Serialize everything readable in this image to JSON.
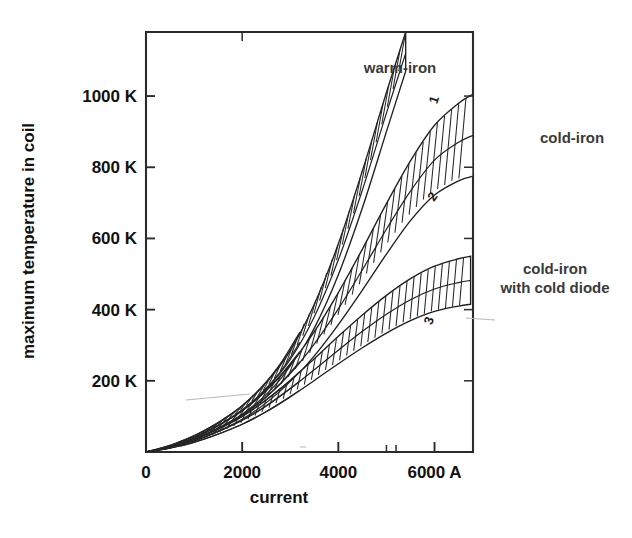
{
  "chart_data": {
    "type": "line",
    "title": "",
    "xlabel": "current",
    "ylabel": "maximum temperature in coil",
    "xlim": [
      0,
      6800
    ],
    "ylim": [
      0,
      1180
    ],
    "xunit": "A",
    "yunit": "K",
    "grid": false,
    "legend_position": "inline-annotations",
    "xticks": [
      {
        "value": 0,
        "label": "0"
      },
      {
        "value": 2000,
        "label": "2000"
      },
      {
        "value": 4000,
        "label": "4000"
      },
      {
        "value": 6000,
        "label": "6000 A"
      }
    ],
    "xminorticks": [
      5000,
      5200
    ],
    "yticks": [
      {
        "value": 200,
        "label": "200 K"
      },
      {
        "value": 400,
        "label": "400 K"
      },
      {
        "value": 600,
        "label": "600 K"
      },
      {
        "value": 800,
        "label": "800 K"
      },
      {
        "value": 1000,
        "label": "1000 K"
      }
    ],
    "annotations": [
      {
        "id": "warm-iron",
        "text": "warm-iron",
        "x": 3900,
        "y": 1010
      },
      {
        "id": "cold-iron",
        "text": "cold-iron",
        "x": 6450,
        "y": 830
      },
      {
        "id": "cold-iron-cold-diode",
        "text": "cold-iron",
        "text2": "with cold diode",
        "x": 6450,
        "y": 465
      }
    ],
    "series": [
      {
        "name": "warm-iron",
        "band_number": "1",
        "hatched": true,
        "x": [
          0,
          500,
          1000,
          1500,
          2000,
          2500,
          3000,
          3500,
          4000,
          4500,
          5000,
          5400
        ],
        "upper": [
          0,
          18,
          45,
          82,
          130,
          195,
          285,
          415,
          585,
          790,
          1010,
          1180
        ],
        "lower": [
          0,
          14,
          36,
          66,
          106,
          160,
          236,
          348,
          498,
          686,
          900,
          1070
        ],
        "mid": [
          0,
          16,
          40,
          74,
          118,
          177,
          260,
          380,
          540,
          736,
          952,
          1120
        ]
      },
      {
        "name": "cold-iron",
        "band_number": "2",
        "hatched": true,
        "x": [
          0,
          500,
          1000,
          1500,
          2000,
          2500,
          3000,
          3500,
          4000,
          4500,
          5000,
          5500,
          6000,
          6500,
          6800
        ],
        "upper": [
          0,
          16,
          40,
          74,
          116,
          172,
          245,
          338,
          448,
          570,
          698,
          818,
          918,
          980,
          1005
        ],
        "lower": [
          0,
          12,
          31,
          58,
          92,
          137,
          196,
          270,
          358,
          455,
          556,
          650,
          722,
          762,
          775
        ],
        "mid": [
          0,
          14,
          35,
          66,
          104,
          154,
          220,
          304,
          402,
          512,
          626,
          733,
          820,
          870,
          890
        ]
      },
      {
        "name": "cold-iron with cold diode",
        "band_number": "3",
        "hatched": true,
        "x": [
          0,
          500,
          1000,
          1500,
          2000,
          2500,
          3000,
          3500,
          4000,
          4500,
          5000,
          5500,
          6000,
          6500,
          6750
        ],
        "upper": [
          0,
          14,
          35,
          64,
          100,
          146,
          201,
          262,
          325,
          385,
          440,
          487,
          522,
          543,
          550
        ],
        "lower": [
          0,
          11,
          27,
          50,
          78,
          113,
          155,
          201,
          248,
          293,
          334,
          369,
          395,
          410,
          415
        ],
        "mid": [
          0,
          12,
          31,
          57,
          89,
          129,
          178,
          231,
          286,
          339,
          387,
          428,
          458,
          476,
          482
        ]
      }
    ]
  },
  "figure": {
    "background_color": "#ffffff",
    "line_color": "#262626",
    "text_color": "#111111",
    "annotation_color": "#3a3a3a"
  }
}
